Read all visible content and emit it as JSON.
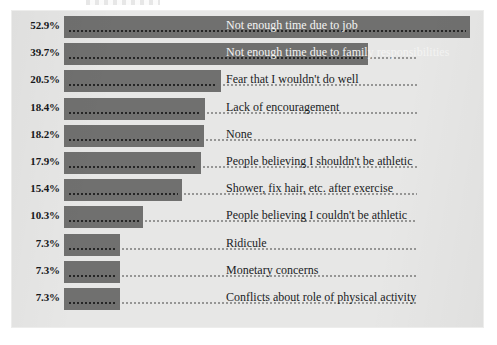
{
  "panel": {
    "background_color": "#e7e7e6",
    "bar_color": "#70706f",
    "label_color": "#1a1c1e",
    "label_on_bar_color": "#f4f4f3"
  },
  "chart_data": {
    "type": "bar",
    "orientation": "horizontal",
    "title": "",
    "subtitle": "",
    "xlabel": "",
    "ylabel": "",
    "xlim": [
      0,
      53
    ],
    "grid": false,
    "legend": null,
    "value_suffix": "%",
    "categories": [
      "Not enough time due to job",
      "Not enough time due to family responsibilities",
      "Fear that I wouldn't do well",
      "Lack of encouragement",
      "None",
      "People believing I shouldn't be athletic",
      "Shower, fix hair, etc. after exercise",
      "People believing I couldn't be athletic",
      "Ridicule",
      "Monetary concerns",
      "Conflicts about role of physical activity"
    ],
    "values": [
      52.9,
      39.7,
      20.5,
      18.4,
      18.2,
      17.9,
      15.4,
      10.3,
      7.3,
      7.3,
      7.3
    ],
    "value_labels": [
      "52.9%",
      "39.7%",
      "20.5%",
      "18.4%",
      "18.2%",
      "17.9%",
      "15.4%",
      "10.3%",
      "7.3%",
      "7.3%",
      "7.3%"
    ]
  }
}
